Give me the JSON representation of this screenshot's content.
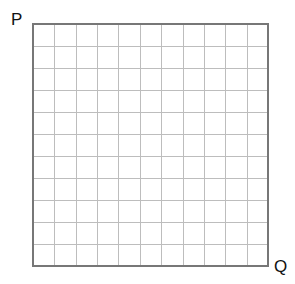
{
  "diagram": {
    "labels": {
      "top_left": "P",
      "bottom_right": "Q"
    },
    "grid": {
      "columns": 11,
      "rows": 11,
      "left": 33,
      "top": 24,
      "right": 268,
      "bottom": 266,
      "border_color": "#777777",
      "border_width": 2,
      "line_color": "#bdbdbd",
      "line_width": 1
    }
  }
}
